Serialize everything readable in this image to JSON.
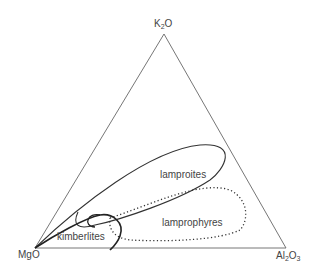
{
  "diagram": {
    "type": "ternary",
    "vertices": {
      "top": {
        "formula": "K",
        "sub": "2",
        "tail": "O"
      },
      "left": {
        "formula": "MgO",
        "sub": "",
        "tail": ""
      },
      "right": {
        "formula": "Al",
        "sub": "2",
        "tail": "O",
        "sub2": "3"
      }
    },
    "fields": [
      {
        "name": "lamproites",
        "style": "solid"
      },
      {
        "name": "lamprophyres",
        "style": "dotted"
      },
      {
        "name": "kimberlites",
        "style": "solid-bold"
      }
    ],
    "colors": {
      "line": "#555555",
      "field": "#333333",
      "text": "#444444"
    }
  }
}
